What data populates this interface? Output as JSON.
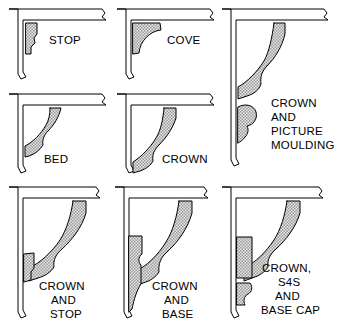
{
  "figure": {
    "background_color": "#ffffff",
    "line_color": "#000000",
    "hatch_fill_color": "#d8d8d8",
    "structure_fill_color": "#ffffff",
    "panels": [
      {
        "id": "stop",
        "label": "STOP",
        "label_lines": [
          "STOP"
        ],
        "moldings": [
          "stop"
        ],
        "grid": "row1-col1"
      },
      {
        "id": "cove",
        "label": "COVE",
        "label_lines": [
          "COVE"
        ],
        "moldings": [
          "cove"
        ],
        "grid": "row1-col2"
      },
      {
        "id": "crown-and-picture-moulding",
        "label": "CROWN AND PICTURE MOULDING",
        "label_lines": [
          "CROWN",
          "AND",
          "PICTURE",
          "MOULDING"
        ],
        "moldings": [
          "crown",
          "picture-moulding"
        ],
        "grid": "col3-tall"
      },
      {
        "id": "bed",
        "label": "BED",
        "label_lines": [
          "BED"
        ],
        "moldings": [
          "bed"
        ],
        "grid": "row2-col1"
      },
      {
        "id": "crown",
        "label": "CROWN",
        "label_lines": [
          "CROWN"
        ],
        "moldings": [
          "crown"
        ],
        "grid": "row2-col2"
      },
      {
        "id": "crown-and-stop",
        "label": "CROWN AND STOP",
        "label_lines": [
          "CROWN",
          "AND",
          "STOP"
        ],
        "moldings": [
          "crown",
          "stop"
        ],
        "grid": "row3-col1"
      },
      {
        "id": "crown-and-base",
        "label": "CROWN AND BASE",
        "label_lines": [
          "CROWN",
          "AND",
          "BASE"
        ],
        "moldings": [
          "crown",
          "base"
        ],
        "grid": "row3-col2"
      },
      {
        "id": "crown-s4s-and-base-cap",
        "label": "CROWN, S4S AND BASE CAP",
        "label_lines": [
          "CROWN,",
          "S4S",
          "AND",
          "BASE CAP"
        ],
        "moldings": [
          "crown",
          "s4s",
          "base-cap"
        ],
        "grid": "row3-col3"
      }
    ]
  }
}
